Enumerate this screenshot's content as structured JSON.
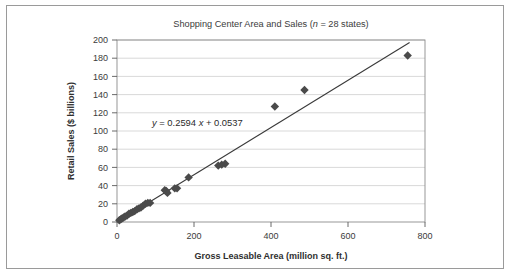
{
  "figure": {
    "background_color": "#ffffff",
    "border_color": "#9a9a9a"
  },
  "chart_data": {
    "type": "scatter",
    "title": "Shopping Center Area and Sales (n = 28 states)",
    "title_parts": {
      "before_italic": "Shopping Center Area and Sales (",
      "italic": "n",
      "after_italic": " = 28 states)"
    },
    "xlabel": "Gross Leasable Area (million sq. ft.)",
    "ylabel": "Retail Sales ($ billions)",
    "xlim": [
      0,
      800
    ],
    "ylim": [
      0,
      200
    ],
    "xticks": [
      0,
      200,
      400,
      600,
      800
    ],
    "yticks": [
      0,
      20,
      40,
      60,
      80,
      100,
      120,
      140,
      160,
      180,
      200
    ],
    "grid": "horizontal",
    "legend": "none",
    "annotation": {
      "text": "y = 0.2594 x + 0.0537",
      "parts": {
        "y": "y",
        "eq": " = 0.2594 ",
        "x": "x",
        "tail": " + 0.0537"
      },
      "x": 120,
      "y": 104
    },
    "trendline": {
      "slope": 0.2594,
      "intercept": 0.0537,
      "x_start": 0,
      "x_end": 760,
      "color": "#3a3a3a"
    },
    "marker": {
      "shape": "diamond",
      "color": "#4a4a4a",
      "size": 4.2
    },
    "series": [
      {
        "name": "states",
        "n": 28,
        "points": [
          [
            6,
            2
          ],
          [
            10,
            3
          ],
          [
            13,
            4
          ],
          [
            17,
            5
          ],
          [
            21,
            6
          ],
          [
            26,
            7
          ],
          [
            31,
            9
          ],
          [
            36,
            10
          ],
          [
            41,
            11
          ],
          [
            46,
            12
          ],
          [
            52,
            14
          ],
          [
            57,
            15
          ],
          [
            62,
            16
          ],
          [
            68,
            18
          ],
          [
            74,
            20
          ],
          [
            80,
            21
          ],
          [
            86,
            21
          ],
          [
            124,
            35
          ],
          [
            128,
            34
          ],
          [
            131,
            32
          ],
          [
            150,
            37
          ],
          [
            156,
            37
          ],
          [
            186,
            49
          ],
          [
            263,
            62
          ],
          [
            272,
            63
          ],
          [
            281,
            64
          ],
          [
            410,
            127
          ],
          [
            487,
            145
          ],
          [
            755,
            183
          ]
        ]
      }
    ]
  }
}
